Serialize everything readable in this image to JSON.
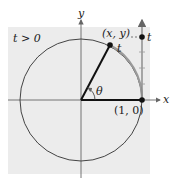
{
  "diagram": {
    "condition_label": "t > 0",
    "axes": {
      "x_label": "x",
      "y_label": "y"
    },
    "points": {
      "terminal": {
        "label": "(x, y)"
      },
      "start": {
        "label": "(1, 0)"
      },
      "number_line_point": {
        "label": "t"
      }
    },
    "arc_label": "t",
    "angle_label": "θ",
    "colors": {
      "background": "#ececec",
      "circle": "#444444",
      "arc": "#9a9a9a",
      "radius": "#111111",
      "axis": "#666666"
    }
  }
}
